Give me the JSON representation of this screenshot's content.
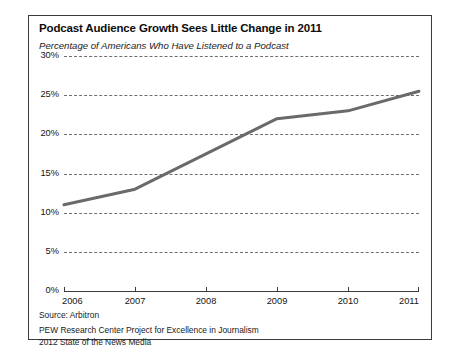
{
  "chart_data": {
    "type": "line",
    "title": "Podcast Audience Growth Sees Little Change in 2011",
    "subtitle": "Percentage of Americans Who Have Listened to a Podcast",
    "xlabel": "",
    "ylabel": "",
    "categories": [
      "2006",
      "2007",
      "2008",
      "2009",
      "2010",
      "2011"
    ],
    "x": [
      2006,
      2007,
      2008,
      2009,
      2010,
      2011
    ],
    "values": [
      11,
      13,
      17.5,
      22,
      23,
      25.5
    ],
    "series": [
      {
        "name": "Percentage of Americans Who Have Listened to a Podcast",
        "values": [
          11,
          13,
          17.5,
          22,
          23,
          25.5
        ]
      }
    ],
    "ylim": [
      0,
      30
    ],
    "yticks": [
      0,
      5,
      10,
      15,
      20,
      25,
      30
    ],
    "ytick_labels": [
      "0%",
      "5%",
      "10%",
      "15%",
      "20%",
      "25%",
      "30%"
    ],
    "xlim": [
      2006,
      2011
    ],
    "grid": "horizontal-dashed",
    "legend": "none",
    "line_color": "#6a6a6a",
    "frame_color": "#3b3b3b"
  },
  "source": "Source: Arbitron",
  "credit": {
    "line1": "PEW Research Center Project for Excellence in Journalism",
    "line2": "2012 State of the News Media"
  }
}
